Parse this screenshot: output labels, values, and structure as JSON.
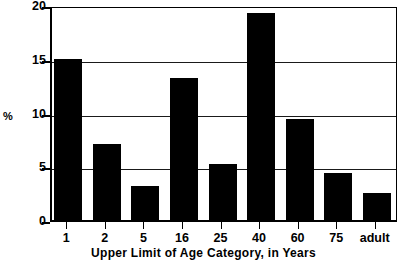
{
  "chart_data": {
    "type": "bar",
    "title": "",
    "subtitle": "",
    "xlabel": "Upper Limit of Age Category, in Years",
    "ylabel": "%",
    "categories": [
      "1",
      "2",
      "5",
      "16",
      "25",
      "40",
      "60",
      "75",
      "adult"
    ],
    "values": [
      15.0,
      7.1,
      3.2,
      13.2,
      5.2,
      19.3,
      9.4,
      4.4,
      2.5
    ],
    "series": [
      {
        "name": "Percent",
        "values": [
          15.0,
          7.1,
          3.2,
          13.2,
          5.2,
          19.3,
          9.4,
          4.4,
          2.5
        ]
      }
    ],
    "ylim": [
      0,
      20
    ],
    "yticks": [
      0,
      5,
      10,
      15,
      20
    ],
    "ytick_labels": [
      "0",
      "5",
      "10",
      "15",
      "20"
    ],
    "grid": true,
    "grid_axis": "y",
    "legend": false,
    "legend_position": "none",
    "bar_color": "#000000",
    "frame_color": "#000000",
    "background": "#ffffff"
  }
}
